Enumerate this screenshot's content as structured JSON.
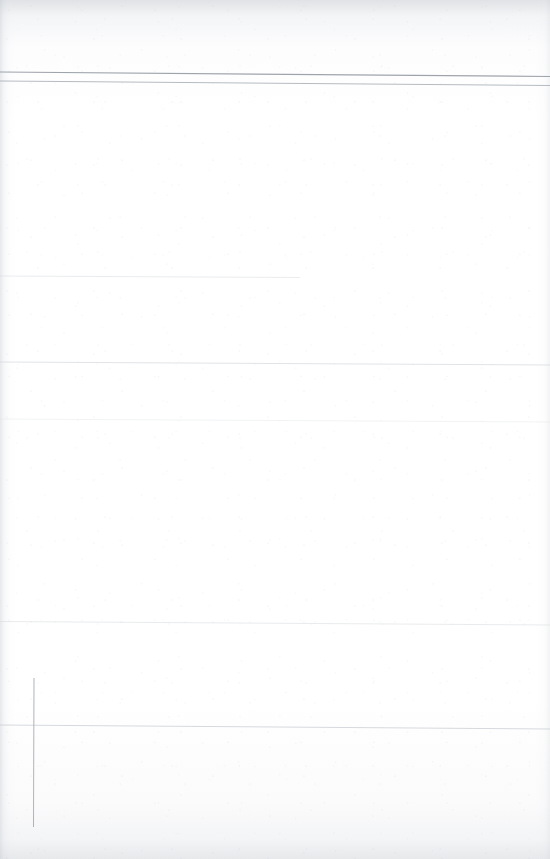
{
  "document": {
    "kind": "scanned-page",
    "page_content_text": "",
    "visible_text": "",
    "note_text": "",
    "page_label": "",
    "header_text": "",
    "footer_text": ""
  },
  "canvas": {
    "width": 550,
    "height": 859,
    "paper_color": "#ffffff",
    "background_color": "#fefeff",
    "edge_shadow_color": "#c4c8ce"
  },
  "rules": {
    "items": [
      {
        "id": "top-rule-primary",
        "name": "top-rule-primary",
        "orientation": "horizontal",
        "x1": 0,
        "y1": 72.0,
        "x2": 550,
        "y2": 76.5,
        "stroke": "#9aa0a8",
        "width": 1.1,
        "opacity": 0.95
      },
      {
        "id": "top-rule-secondary",
        "name": "top-rule-secondary",
        "orientation": "horizontal",
        "x1": 0,
        "y1": 81.0,
        "x2": 550,
        "y2": 85.5,
        "stroke": "#aeb4ba",
        "width": 1.0,
        "opacity": 0.9
      },
      {
        "id": "faint-rule-1",
        "name": "faint-rule-upper",
        "orientation": "horizontal",
        "x1": 0,
        "y1": 276.0,
        "x2": 300,
        "y2": 277.5,
        "stroke": "#d4d8dd",
        "width": 0.9,
        "opacity": 0.55
      },
      {
        "id": "faint-rule-2",
        "name": "faint-rule-mid-upper",
        "orientation": "horizontal",
        "x1": 0,
        "y1": 362.0,
        "x2": 550,
        "y2": 365.0,
        "stroke": "#cfd4d9",
        "width": 0.9,
        "opacity": 0.7
      },
      {
        "id": "faint-rule-3",
        "name": "faint-rule-mid",
        "orientation": "horizontal",
        "x1": 0,
        "y1": 419.0,
        "x2": 550,
        "y2": 422.0,
        "stroke": "#dde1e5",
        "width": 0.8,
        "opacity": 0.5
      },
      {
        "id": "faint-rule-4",
        "name": "faint-rule-lower",
        "orientation": "horizontal",
        "x1": 0,
        "y1": 621.5,
        "x2": 550,
        "y2": 625.0,
        "stroke": "#d6dadf",
        "width": 0.9,
        "opacity": 0.6
      },
      {
        "id": "faint-rule-5",
        "name": "faint-rule-bottom",
        "orientation": "horizontal",
        "x1": 0,
        "y1": 725.0,
        "x2": 550,
        "y2": 729.0,
        "stroke": "#c8cdd3",
        "width": 1.0,
        "opacity": 0.75
      },
      {
        "id": "left-vertical-rule",
        "name": "left-vertical-rule",
        "orientation": "vertical",
        "x1": 34.0,
        "y1": 678.0,
        "x2": 33.5,
        "y2": 827.0,
        "stroke": "#a8aeb4",
        "width": 1.0,
        "opacity": 0.92
      }
    ]
  }
}
